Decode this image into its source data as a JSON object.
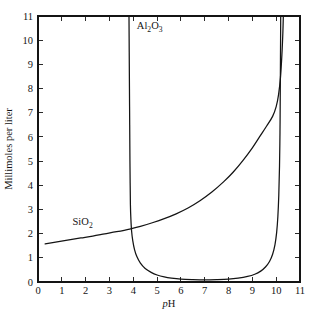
{
  "chart_data": {
    "type": "line",
    "title": "",
    "subtitle": "",
    "xlabel": "pH",
    "xlabel_parts": {
      "italic": "p",
      "roman": "H"
    },
    "ylabel": "Millimoles per liter",
    "xlim": [
      0,
      11
    ],
    "ylim": [
      0,
      11
    ],
    "xticks": [
      0,
      1,
      2,
      3,
      4,
      5,
      6,
      7,
      8,
      9,
      10,
      11
    ],
    "yticks": [
      0,
      1,
      2,
      3,
      4,
      5,
      6,
      7,
      8,
      9,
      10,
      11
    ],
    "xtick_labels": [
      "0",
      "1",
      "2",
      "3",
      "4",
      "5",
      "6",
      "7",
      "8",
      "9",
      "10",
      "11"
    ],
    "ytick_labels": [
      "0",
      "1",
      "2",
      "3",
      "4",
      "5",
      "6",
      "7",
      "8",
      "9",
      "10",
      "11"
    ],
    "grid": false,
    "legend_position": "inline-annotations",
    "frame": "box-all-sides",
    "tick_direction": "in",
    "line_color": "#141414",
    "background_color": "#ffffff",
    "series": [
      {
        "name": "Al2O3",
        "label": "Al₂O₃",
        "label_parts": {
          "pre": "Al",
          "sub1": "2",
          "mid": "O",
          "sub2": "3"
        },
        "annotation_x": 4.15,
        "annotation_y": 10.45,
        "description": "U-shaped amphoteric solubility curve with vertical asymptotes near pH 3.85 and pH 10.15",
        "points": [
          [
            3.82,
            11.0
          ],
          [
            3.83,
            9.5
          ],
          [
            3.84,
            8.0
          ],
          [
            3.85,
            6.5
          ],
          [
            3.86,
            5.0
          ],
          [
            3.87,
            4.0
          ],
          [
            3.88,
            3.2
          ],
          [
            3.9,
            2.6
          ],
          [
            3.93,
            2.1
          ],
          [
            3.98,
            1.7
          ],
          [
            4.05,
            1.35
          ],
          [
            4.15,
            1.05
          ],
          [
            4.3,
            0.78
          ],
          [
            4.5,
            0.56
          ],
          [
            4.75,
            0.4
          ],
          [
            5.0,
            0.29
          ],
          [
            5.3,
            0.21
          ],
          [
            5.6,
            0.16
          ],
          [
            6.0,
            0.12
          ],
          [
            6.5,
            0.1
          ],
          [
            7.0,
            0.09
          ],
          [
            7.5,
            0.1
          ],
          [
            8.0,
            0.12
          ],
          [
            8.4,
            0.16
          ],
          [
            8.8,
            0.23
          ],
          [
            9.1,
            0.32
          ],
          [
            9.35,
            0.45
          ],
          [
            9.55,
            0.62
          ],
          [
            9.72,
            0.85
          ],
          [
            9.85,
            1.15
          ],
          [
            9.95,
            1.55
          ],
          [
            10.02,
            2.05
          ],
          [
            10.07,
            2.7
          ],
          [
            10.11,
            3.6
          ],
          [
            10.14,
            4.8
          ],
          [
            10.16,
            6.2
          ],
          [
            10.17,
            7.6
          ],
          [
            10.18,
            9.2
          ],
          [
            10.19,
            11.0
          ]
        ]
      },
      {
        "name": "SiO2",
        "label": "SiO₂",
        "label_parts": {
          "pre": "SiO",
          "sub1": "2"
        },
        "annotation_x": 1.45,
        "annotation_y": 2.35,
        "description": "Monotonically rising silica solubility curve, gentle below pH 8 then steeply vertical above pH 10",
        "points": [
          [
            0.3,
            1.58
          ],
          [
            0.8,
            1.66
          ],
          [
            1.3,
            1.74
          ],
          [
            1.8,
            1.82
          ],
          [
            2.3,
            1.9
          ],
          [
            2.8,
            1.99
          ],
          [
            3.3,
            2.08
          ],
          [
            3.85,
            2.19
          ],
          [
            4.3,
            2.3
          ],
          [
            4.8,
            2.45
          ],
          [
            5.3,
            2.62
          ],
          [
            5.8,
            2.82
          ],
          [
            6.3,
            3.06
          ],
          [
            6.8,
            3.36
          ],
          [
            7.3,
            3.72
          ],
          [
            7.8,
            4.15
          ],
          [
            8.2,
            4.55
          ],
          [
            8.6,
            5.02
          ],
          [
            9.0,
            5.55
          ],
          [
            9.3,
            6.0
          ],
          [
            9.6,
            6.45
          ],
          [
            9.85,
            6.85
          ],
          [
            10.0,
            7.25
          ],
          [
            10.1,
            7.75
          ],
          [
            10.18,
            8.45
          ],
          [
            10.24,
            9.4
          ],
          [
            10.28,
            10.3
          ],
          [
            10.3,
            11.0
          ]
        ]
      }
    ]
  }
}
